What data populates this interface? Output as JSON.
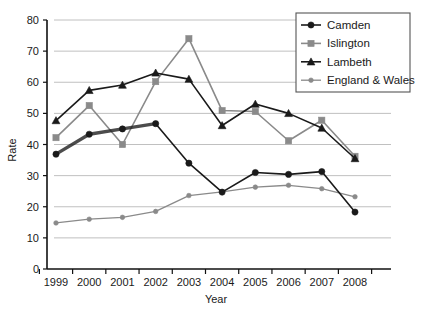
{
  "chart_data": {
    "type": "line",
    "title": "",
    "xlabel": "Year",
    "ylabel": "Rate",
    "categories": [
      "1999",
      "2000",
      "2001",
      "2002",
      "2003",
      "2004",
      "2005",
      "2006",
      "2007",
      "2008"
    ],
    "x": [
      1999,
      2000,
      2001,
      2002,
      2003,
      2004,
      2005,
      2006,
      2007,
      2008
    ],
    "xlim": [
      1999,
      2008
    ],
    "ylim": [
      0,
      80
    ],
    "yticks": [
      0,
      10,
      20,
      30,
      40,
      50,
      60,
      70,
      80
    ],
    "ytick_labels": [
      "0",
      "10",
      "20",
      "30",
      "40",
      "50",
      "60",
      "70",
      "80"
    ],
    "grid": "horizontal",
    "legend_position": "top-right",
    "series": [
      {
        "name": "Camden",
        "color": "#1a1a1a",
        "marker": "circle",
        "values": [
          36.9,
          43.3,
          45.0,
          46.7,
          34.0,
          24.7,
          31.0,
          30.4,
          31.3,
          18.3
        ]
      },
      {
        "name": "Islington",
        "color": "#8a8a8a",
        "marker": "square",
        "values": [
          42.2,
          52.5,
          40.0,
          60.2,
          74.0,
          50.9,
          50.6,
          41.2,
          47.8,
          36.2
        ]
      },
      {
        "name": "Lambeth",
        "color": "#1a1a1a",
        "marker": "triangle",
        "values": [
          47.7,
          57.4,
          59.1,
          63.0,
          61.0,
          46.1,
          53.0,
          50.0,
          45.3,
          35.5
        ]
      },
      {
        "name": "England & Wales",
        "color": "#8a8a8a",
        "marker": "small-circle",
        "values": [
          14.8,
          16.0,
          16.6,
          18.5,
          23.6,
          24.8,
          26.3,
          26.9,
          25.8,
          23.2
        ]
      }
    ]
  },
  "legend": {
    "items": [
      {
        "label": "Camden"
      },
      {
        "label": "Islington"
      },
      {
        "label": "Lambeth"
      },
      {
        "label": "England & Wales"
      }
    ]
  },
  "axes": {
    "y_title": "Rate",
    "x_title": "Year"
  },
  "colors": {
    "dark": "#1a1a1a",
    "gray": "#8a8a8a",
    "grid": "#b9b9b9",
    "background": "#ffffff"
  }
}
